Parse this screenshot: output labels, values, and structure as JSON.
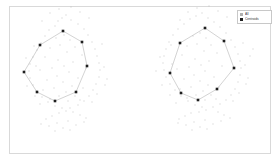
{
  "figure": {
    "background_color": "#ffffff",
    "frame_color": "#d9d9d9",
    "title": "",
    "xlabel": "",
    "ylabel": ""
  },
  "legend": {
    "position": "upper-right",
    "border_color": "#c8c8c8",
    "entries": [
      {
        "label": "All",
        "marker": "square",
        "color": "#b0b0b0"
      },
      {
        "label": "Centroids",
        "marker": "square",
        "color": "#202020"
      }
    ]
  },
  "chart_data": {
    "type": "scatter",
    "title": "",
    "xlabel": "",
    "ylabel": "",
    "grid": false,
    "legend_position": "upper right",
    "xlim": [
      0,
      280
    ],
    "ylim": [
      0,
      164
    ],
    "series": [
      {
        "name": "All",
        "marker": "square",
        "color": "#b8b8b8",
        "size": 0.9,
        "points": [
          [
            62,
            18
          ],
          [
            66,
            15
          ],
          [
            58,
            21
          ],
          [
            71,
            20
          ],
          [
            55,
            26
          ],
          [
            78,
            24
          ],
          [
            49,
            30
          ],
          [
            84,
            29
          ],
          [
            45,
            36
          ],
          [
            88,
            35
          ],
          [
            41,
            43
          ],
          [
            92,
            42
          ],
          [
            37,
            50
          ],
          [
            95,
            49
          ],
          [
            33,
            57
          ],
          [
            97,
            56
          ],
          [
            30,
            64
          ],
          [
            99,
            63
          ],
          [
            29,
            71
          ],
          [
            100,
            70
          ],
          [
            30,
            78
          ],
          [
            99,
            77
          ],
          [
            33,
            85
          ],
          [
            96,
            84
          ],
          [
            37,
            91
          ],
          [
            93,
            90
          ],
          [
            42,
            97
          ],
          [
            89,
            96
          ],
          [
            48,
            102
          ],
          [
            84,
            101
          ],
          [
            55,
            106
          ],
          [
            78,
            105
          ],
          [
            62,
            108
          ],
          [
            70,
            108
          ],
          [
            66,
            111
          ],
          [
            59,
            113
          ],
          [
            73,
            112
          ],
          [
            52,
            116
          ],
          [
            80,
            115
          ],
          [
            46,
            119
          ],
          [
            86,
            118
          ],
          [
            64,
            35
          ],
          [
            70,
            40
          ],
          [
            56,
            38
          ],
          [
            60,
            45
          ],
          [
            75,
            47
          ],
          [
            50,
            48
          ],
          [
            67,
            52
          ],
          [
            82,
            55
          ],
          [
            45,
            57
          ],
          [
            58,
            60
          ],
          [
            73,
            62
          ],
          [
            64,
            66
          ],
          [
            52,
            68
          ],
          [
            86,
            68
          ],
          [
            40,
            70
          ],
          [
            69,
            72
          ],
          [
            57,
            76
          ],
          [
            78,
            78
          ],
          [
            47,
            80
          ],
          [
            63,
            82
          ],
          [
            72,
            86
          ],
          [
            54,
            88
          ],
          [
            83,
            88
          ],
          [
            43,
            90
          ],
          [
            66,
            92
          ],
          [
            59,
            96
          ],
          [
            75,
            96
          ],
          [
            50,
            99
          ],
          [
            80,
            100
          ],
          [
            68,
            101
          ],
          [
            36,
            66
          ],
          [
            104,
            67
          ],
          [
            34,
            46
          ],
          [
            102,
            44
          ],
          [
            26,
            58
          ],
          [
            107,
            79
          ],
          [
            71,
            7
          ],
          [
            59,
            9
          ],
          [
            80,
            12
          ],
          [
            50,
            13
          ],
          [
            89,
            18
          ],
          [
            42,
            21
          ],
          [
            92,
            102
          ],
          [
            40,
            104
          ],
          [
            97,
            94
          ],
          [
            35,
            96
          ],
          [
            105,
            85
          ],
          [
            27,
            86
          ],
          [
            68,
            121
          ],
          [
            57,
            123
          ],
          [
            76,
            125
          ],
          [
            49,
            126
          ],
          [
            84,
            122
          ],
          [
            41,
            124
          ],
          [
            63,
            128
          ],
          [
            70,
            130
          ],
          [
            55,
            131
          ],
          [
            196,
            16
          ],
          [
            202,
            13
          ],
          [
            190,
            19
          ],
          [
            208,
            18
          ],
          [
            184,
            24
          ],
          [
            214,
            22
          ],
          [
            178,
            29
          ],
          [
            220,
            27
          ],
          [
            173,
            35
          ],
          [
            226,
            33
          ],
          [
            169,
            42
          ],
          [
            231,
            40
          ],
          [
            166,
            49
          ],
          [
            235,
            47
          ],
          [
            164,
            56
          ],
          [
            238,
            54
          ],
          [
            163,
            63
          ],
          [
            240,
            61
          ],
          [
            164,
            70
          ],
          [
            241,
            68
          ],
          [
            166,
            77
          ],
          [
            240,
            75
          ],
          [
            170,
            84
          ],
          [
            238,
            82
          ],
          [
            175,
            90
          ],
          [
            235,
            89
          ],
          [
            181,
            96
          ],
          [
            231,
            95
          ],
          [
            188,
            101
          ],
          [
            226,
            100
          ],
          [
            195,
            105
          ],
          [
            220,
            104
          ],
          [
            202,
            107
          ],
          [
            213,
            107
          ],
          [
            206,
            110
          ],
          [
            199,
            112
          ],
          [
            191,
            113
          ],
          [
            185,
            116
          ],
          [
            218,
            112
          ],
          [
            224,
            115
          ],
          [
            179,
            119
          ],
          [
            230,
            118
          ],
          [
            200,
            33
          ],
          [
            206,
            38
          ],
          [
            193,
            36
          ],
          [
            197,
            44
          ],
          [
            211,
            45
          ],
          [
            187,
            46
          ],
          [
            204,
            51
          ],
          [
            217,
            53
          ],
          [
            182,
            55
          ],
          [
            195,
            59
          ],
          [
            209,
            61
          ],
          [
            201,
            65
          ],
          [
            189,
            67
          ],
          [
            222,
            66
          ],
          [
            177,
            69
          ],
          [
            205,
            71
          ],
          [
            194,
            75
          ],
          [
            214,
            77
          ],
          [
            184,
            79
          ],
          [
            200,
            81
          ],
          [
            208,
            85
          ],
          [
            191,
            87
          ],
          [
            219,
            87
          ],
          [
            180,
            89
          ],
          [
            203,
            91
          ],
          [
            196,
            95
          ],
          [
            211,
            95
          ],
          [
            187,
            98
          ],
          [
            216,
            99
          ],
          [
            205,
            100
          ],
          [
            172,
            64
          ],
          [
            245,
            65
          ],
          [
            171,
            45
          ],
          [
            243,
            43
          ],
          [
            160,
            57
          ],
          [
            248,
            78
          ],
          [
            209,
            6
          ],
          [
            197,
            8
          ],
          [
            218,
            11
          ],
          [
            188,
            12
          ],
          [
            227,
            17
          ],
          [
            180,
            20
          ],
          [
            233,
            101
          ],
          [
            176,
            103
          ],
          [
            239,
            93
          ],
          [
            170,
            95
          ],
          [
            246,
            84
          ],
          [
            162,
            85
          ],
          [
            205,
            120
          ],
          [
            194,
            122
          ],
          [
            213,
            124
          ],
          [
            186,
            125
          ],
          [
            221,
            121
          ],
          [
            178,
            123
          ],
          [
            200,
            127
          ],
          [
            207,
            129
          ],
          [
            192,
            130
          ],
          [
            250,
            56
          ],
          [
            253,
            49
          ],
          [
            156,
            71
          ]
        ]
      },
      {
        "name": "Centroids",
        "marker": "square",
        "color": "#1f1f1f",
        "size": 2.6,
        "clusters": [
          {
            "name": "left-octagon",
            "vertices": [
              [
                63,
                31
              ],
              [
                82,
                42
              ],
              [
                87,
                66
              ],
              [
                76,
                92
              ],
              [
                55,
                101
              ],
              [
                37,
                92
              ],
              [
                24,
                72
              ],
              [
                40,
                45
              ]
            ],
            "edge_color": "#c0c0c0"
          },
          {
            "name": "right-octagon",
            "vertices": [
              [
                205,
                28
              ],
              [
                224,
                41
              ],
              [
                234,
                68
              ],
              [
                217,
                89
              ],
              [
                198,
                100
              ],
              [
                181,
                93
              ],
              [
                170,
                73
              ],
              [
                180,
                43
              ]
            ],
            "edge_color": "#c0c0c0"
          }
        ]
      }
    ]
  }
}
